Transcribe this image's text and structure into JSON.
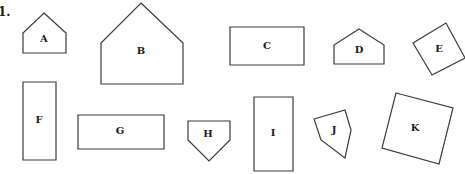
{
  "question_number": "1.",
  "shapes": [
    {
      "id": "A",
      "label": "A",
      "type": "pentagon",
      "points": [
        [
          44,
          13
        ],
        [
          66,
          33
        ],
        [
          66,
          53
        ],
        [
          23,
          53
        ],
        [
          23,
          33
        ]
      ],
      "label_pos": [
        44,
        39
      ]
    },
    {
      "id": "B",
      "label": "B",
      "type": "pentagon",
      "points": [
        [
          141,
          3
        ],
        [
          183,
          43
        ],
        [
          183,
          84
        ],
        [
          101,
          84
        ],
        [
          101,
          43
        ]
      ],
      "label_pos": [
        141,
        51
      ]
    },
    {
      "id": "C",
      "label": "C",
      "type": "rectangle",
      "points": [
        [
          230,
          27
        ],
        [
          304,
          27
        ],
        [
          304,
          65
        ],
        [
          230,
          65
        ]
      ],
      "label_pos": [
        267,
        46
      ]
    },
    {
      "id": "D",
      "label": "D",
      "type": "pentagon",
      "points": [
        [
          359,
          29
        ],
        [
          384,
          45
        ],
        [
          384,
          64
        ],
        [
          334,
          64
        ],
        [
          334,
          45
        ]
      ],
      "label_pos": [
        359,
        50
      ]
    },
    {
      "id": "E",
      "label": "E",
      "type": "rotated-square",
      "points": [
        [
          446,
          23
        ],
        [
          465,
          58
        ],
        [
          432,
          75
        ],
        [
          413,
          43
        ]
      ],
      "label_pos": [
        439,
        49
      ]
    },
    {
      "id": "F",
      "label": "F",
      "type": "rectangle",
      "points": [
        [
          23,
          82
        ],
        [
          56,
          82
        ],
        [
          56,
          160
        ],
        [
          23,
          160
        ]
      ],
      "label_pos": [
        39,
        120
      ]
    },
    {
      "id": "G",
      "label": "G",
      "type": "rectangle",
      "points": [
        [
          78,
          115
        ],
        [
          164,
          115
        ],
        [
          164,
          149
        ],
        [
          78,
          149
        ]
      ],
      "label_pos": [
        120,
        131
      ]
    },
    {
      "id": "H",
      "label": "H",
      "type": "pentagon",
      "points": [
        [
          188,
          121
        ],
        [
          230,
          121
        ],
        [
          230,
          140
        ],
        [
          209,
          161
        ],
        [
          188,
          140
        ]
      ],
      "label_pos": [
        208,
        134
      ]
    },
    {
      "id": "I",
      "label": "I",
      "type": "rectangle",
      "points": [
        [
          254,
          97
        ],
        [
          293,
          97
        ],
        [
          293,
          171
        ],
        [
          254,
          171
        ]
      ],
      "label_pos": [
        273,
        133
      ]
    },
    {
      "id": "J",
      "label": "J",
      "type": "irregular-pentagon",
      "points": [
        [
          314,
          119
        ],
        [
          345,
          110
        ],
        [
          351,
          130
        ],
        [
          345,
          158
        ],
        [
          321,
          140
        ]
      ],
      "label_pos": [
        334,
        130
      ]
    },
    {
      "id": "K",
      "label": "K",
      "type": "rotated-square",
      "points": [
        [
          396,
          93
        ],
        [
          453,
          108
        ],
        [
          439,
          164
        ],
        [
          382,
          148
        ]
      ],
      "label_pos": [
        415,
        128
      ]
    }
  ],
  "colors": {
    "stroke": "#3a3a3a",
    "fill": "#ffffff",
    "text": "#1a1a1a"
  }
}
